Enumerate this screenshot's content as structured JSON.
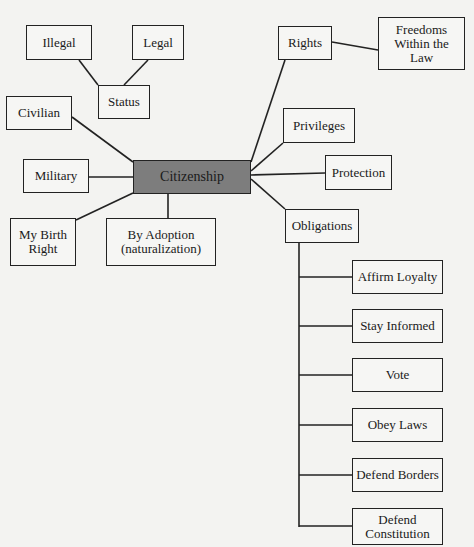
{
  "diagram": {
    "type": "concept-map",
    "center": {
      "label": "Citizenship",
      "fill": "#7d7d7d"
    },
    "nodes": {
      "illegal": "Illegal",
      "legal": "Legal",
      "status": "Status",
      "civilian": "Civilian",
      "military": "Military",
      "birth_right": "My Birth\nRight",
      "adoption": "By Adoption\n(naturalization)",
      "rights": "Rights",
      "freedoms": "Freedoms\nWithin the\nLaw",
      "privileges": "Privileges",
      "protection": "Protection",
      "obligations": "Obligations"
    },
    "obligations_items": [
      "Affirm Loyalty",
      "Stay Informed",
      "Vote",
      "Obey Laws",
      "Defend Borders",
      "Defend\nConstitution"
    ],
    "edges": [
      [
        "Citizenship",
        "Status"
      ],
      [
        "Status",
        "Illegal"
      ],
      [
        "Status",
        "Legal"
      ],
      [
        "Citizenship",
        "Civilian"
      ],
      [
        "Citizenship",
        "Military"
      ],
      [
        "Citizenship",
        "My Birth Right"
      ],
      [
        "Citizenship",
        "By Adoption (naturalization)"
      ],
      [
        "Citizenship",
        "Rights"
      ],
      [
        "Rights",
        "Freedoms Within the Law"
      ],
      [
        "Citizenship",
        "Privileges"
      ],
      [
        "Citizenship",
        "Protection"
      ],
      [
        "Citizenship",
        "Obligations"
      ],
      [
        "Obligations",
        "Affirm Loyalty"
      ],
      [
        "Obligations",
        "Stay Informed"
      ],
      [
        "Obligations",
        "Vote"
      ],
      [
        "Obligations",
        "Obey Laws"
      ],
      [
        "Obligations",
        "Defend Borders"
      ],
      [
        "Obligations",
        "Defend Constitution"
      ]
    ]
  }
}
